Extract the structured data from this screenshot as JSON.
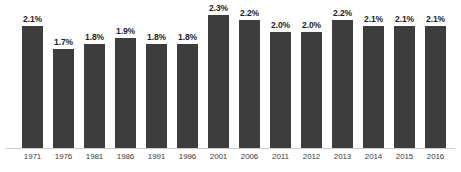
{
  "chart_data": {
    "type": "bar",
    "title": "",
    "xlabel": "",
    "ylabel": "",
    "categories": [
      "1971",
      "1976",
      "1981",
      "1986",
      "1991",
      "1996",
      "2001",
      "2006",
      "2011",
      "2012",
      "2013",
      "2014",
      "2015",
      "2016"
    ],
    "values": [
      2.1,
      1.7,
      1.8,
      1.9,
      1.8,
      1.8,
      2.3,
      2.2,
      2.0,
      2.0,
      2.2,
      2.1,
      2.1,
      2.1
    ],
    "value_labels": [
      "2.1%",
      "1.7%",
      "1.8%",
      "1.9%",
      "1.8%",
      "1.8%",
      "2.3%",
      "2.2%",
      "2.0%",
      "2.0%",
      "2.2%",
      "2.1%",
      "2.1%",
      "2.1%"
    ],
    "ylim": [
      0,
      2.55
    ],
    "grid": false,
    "legend": null,
    "bar_color": "#3d3d3d",
    "label_color": "#1d1d28",
    "axis_color": "#cfcfcf",
    "background": "#ffffff"
  }
}
